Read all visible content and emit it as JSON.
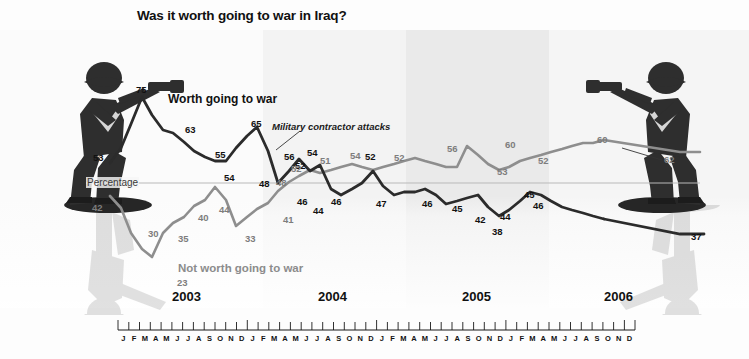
{
  "title": "Was it worth going to war in Iraq?",
  "axis_label": "Percentage",
  "series_labels": {
    "worth": "Worth going to war",
    "not_worth": "Not worth going to war"
  },
  "annotation": "Military contractor attacks",
  "years": [
    "2003",
    "2004",
    "2005",
    "2006"
  ],
  "months": [
    "J",
    "F",
    "M",
    "A",
    "M",
    "J",
    "J",
    "A",
    "S",
    "O",
    "N",
    "D"
  ],
  "colors": {
    "worth_line": "#2b2b2b",
    "not_worth_line": "#8e8e8e",
    "panel_light": "#fbfbfb",
    "panel_shade": "#eeeeee",
    "background": "#fdfdfd",
    "text": "#111111"
  },
  "icons": {
    "soldier_left": "toy-soldier-aiming-right",
    "soldier_right": "toy-soldier-aiming-left"
  },
  "chart_data": {
    "type": "line",
    "title": "Was it worth going to war in Iraq?",
    "xlabel": "",
    "ylabel": "Percentage",
    "ylim": [
      20,
      80
    ],
    "grid": false,
    "legend_position": "inline",
    "x": [
      "2003-01",
      "2003-02",
      "2003-03",
      "2003-04",
      "2003-05",
      "2003-06",
      "2003-07",
      "2003-08",
      "2003-09",
      "2003-10",
      "2003-11",
      "2003-12",
      "2004-01",
      "2004-02",
      "2004-03",
      "2004-04",
      "2004-05",
      "2004-06",
      "2004-07",
      "2004-08",
      "2004-09",
      "2004-10",
      "2004-11",
      "2004-12",
      "2005-01",
      "2005-02",
      "2005-03",
      "2005-04",
      "2005-05",
      "2005-06",
      "2005-07",
      "2005-08",
      "2005-09",
      "2005-10",
      "2005-11",
      "2005-12",
      "2006-01",
      "2006-02",
      "2006-03",
      "2006-04",
      "2006-05",
      "2006-06",
      "2006-07",
      "2006-08",
      "2006-09",
      "2006-10",
      "2006-11",
      "2006-12"
    ],
    "series": [
      {
        "name": "Worth going to war",
        "color": "#2b2b2b",
        "labeled_points": [
          {
            "x": "2003-01",
            "value": 53
          },
          {
            "x": "2003-04",
            "value": 75
          },
          {
            "x": "2003-07",
            "value": 63
          },
          {
            "x": "2003-10",
            "value": 55
          },
          {
            "x": "2003-12",
            "value": 54
          },
          {
            "x": "2004-03",
            "value": 65
          },
          {
            "x": "2004-05",
            "value": 48
          },
          {
            "x": "2004-07",
            "value": 56
          },
          {
            "x": "2004-08",
            "value": 52
          },
          {
            "x": "2004-09",
            "value": 54
          },
          {
            "x": "2004-10",
            "value": 46
          },
          {
            "x": "2004-11",
            "value": 44
          },
          {
            "x": "2004-12",
            "value": 46
          },
          {
            "x": "2005-02",
            "value": 52
          },
          {
            "x": "2005-03",
            "value": 47
          },
          {
            "x": "2005-06",
            "value": 46
          },
          {
            "x": "2005-08",
            "value": 45
          },
          {
            "x": "2005-09",
            "value": 42
          },
          {
            "x": "2005-11",
            "value": 44
          },
          {
            "x": "2005-12",
            "value": 45
          },
          {
            "x": "2006-02",
            "value": 38
          },
          {
            "x": "2006-05",
            "value": 46
          },
          {
            "x": "2006-12",
            "value": 37
          }
        ],
        "values": [
          53,
          58,
          66,
          75,
          69,
          64,
          63,
          60,
          57,
          55,
          54,
          54,
          58,
          62,
          65,
          57,
          48,
          52,
          56,
          52,
          54,
          46,
          44,
          46,
          48,
          52,
          47,
          45,
          46,
          46,
          47,
          45,
          42,
          43,
          44,
          45,
          41,
          38,
          40,
          43,
          46,
          45,
          43,
          41,
          40,
          39,
          38,
          37
        ]
      },
      {
        "name": "Not worth going to war",
        "color": "#8e8e8e",
        "labeled_points": [
          {
            "x": "2003-01",
            "value": 42
          },
          {
            "x": "2003-05",
            "value": 23
          },
          {
            "x": "2003-06",
            "value": 30
          },
          {
            "x": "2003-08",
            "value": 35
          },
          {
            "x": "2003-10",
            "value": 40
          },
          {
            "x": "2003-11",
            "value": 44
          },
          {
            "x": "2004-01",
            "value": 33
          },
          {
            "x": "2004-04",
            "value": 41
          },
          {
            "x": "2004-06",
            "value": 48
          },
          {
            "x": "2004-08",
            "value": 52
          },
          {
            "x": "2004-09",
            "value": 51
          },
          {
            "x": "2004-12",
            "value": 54
          },
          {
            "x": "2005-02",
            "value": 52
          },
          {
            "x": "2005-06",
            "value": 56
          },
          {
            "x": "2005-10",
            "value": 53
          },
          {
            "x": "2005-11",
            "value": 60
          },
          {
            "x": "2006-01",
            "value": 52
          },
          {
            "x": "2006-09",
            "value": 60
          },
          {
            "x": "2006-12",
            "value": 62
          }
        ],
        "values": [
          42,
          38,
          30,
          25,
          23,
          30,
          33,
          35,
          38,
          40,
          44,
          40,
          33,
          36,
          39,
          41,
          45,
          48,
          50,
          52,
          51,
          52,
          53,
          54,
          53,
          52,
          53,
          54,
          55,
          56,
          55,
          54,
          53,
          53,
          60,
          57,
          54,
          52,
          53,
          55,
          56,
          57,
          58,
          59,
          60,
          61,
          61,
          62
        ]
      }
    ]
  }
}
